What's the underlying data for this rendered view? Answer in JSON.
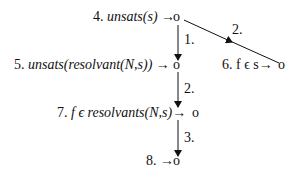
{
  "diagram": {
    "nodes": [
      {
        "id": "4",
        "prefix": "4. ",
        "text": "unsats(s)",
        "arrow": "→",
        "marker": "o",
        "italic": true
      },
      {
        "id": "5",
        "prefix": "5. ",
        "text": "unsats(resolvant(N,s))",
        "arrow": "→",
        "marker": "o",
        "italic": true
      },
      {
        "id": "6",
        "prefix": "6. ",
        "text": "f ϵ s",
        "arrow": "→",
        "marker": "o",
        "italic": false
      },
      {
        "id": "7",
        "prefix": "7. ",
        "text": "f ϵ resolvants(N,s)",
        "arrow": "→",
        "marker": "o",
        "italic": true
      },
      {
        "id": "8",
        "prefix": "8. ",
        "text": "",
        "arrow": "→",
        "marker": "o",
        "italic": false
      }
    ],
    "edges": [
      {
        "from": "4",
        "to": "5",
        "label": "1."
      },
      {
        "from": "4",
        "to": "6",
        "label": "2."
      },
      {
        "from": "5",
        "to": "7",
        "label": "2."
      },
      {
        "from": "7",
        "to": "8",
        "label": "3."
      }
    ],
    "colors": {
      "ink": "#111111",
      "background": "#ffffff"
    }
  }
}
